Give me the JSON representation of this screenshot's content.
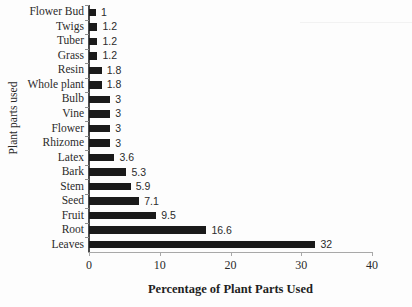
{
  "chart_data": {
    "type": "bar",
    "orientation": "horizontal",
    "title": "",
    "xlabel": "Percentage of Plant Parts Used",
    "ylabel": "Plant parts used",
    "xlim": [
      0,
      40
    ],
    "xticks": [
      0,
      10,
      20,
      30,
      40
    ],
    "xtick_labels": [
      "0",
      "10",
      "20",
      "30",
      "40"
    ],
    "grid": false,
    "legend": null,
    "bar_color": "#1a1a1a",
    "axis_color": "#a8a8a8",
    "data_labels_shown": true,
    "categories": [
      "Flower Bud",
      "Twigs",
      "Tuber",
      "Grass",
      "Resin",
      "Whole plant",
      "Bulb",
      "Vine",
      "Flower",
      "Rhizome",
      "Latex",
      "Bark",
      "Stem",
      "Seed",
      "Fruit",
      "Root",
      "Leaves"
    ],
    "values": [
      1,
      1.2,
      1.2,
      1.2,
      1.8,
      1.8,
      3,
      3,
      3,
      3,
      3.6,
      5.3,
      5.9,
      7.1,
      9.5,
      16.6,
      32
    ],
    "value_labels": [
      "1",
      "1.2",
      "1.2",
      "1.2",
      "1.8",
      "1.8",
      "3",
      "3",
      "3",
      "3",
      "3.6",
      "5.3",
      "5.9",
      "7.1",
      "9.5",
      "16.6",
      "32"
    ]
  }
}
